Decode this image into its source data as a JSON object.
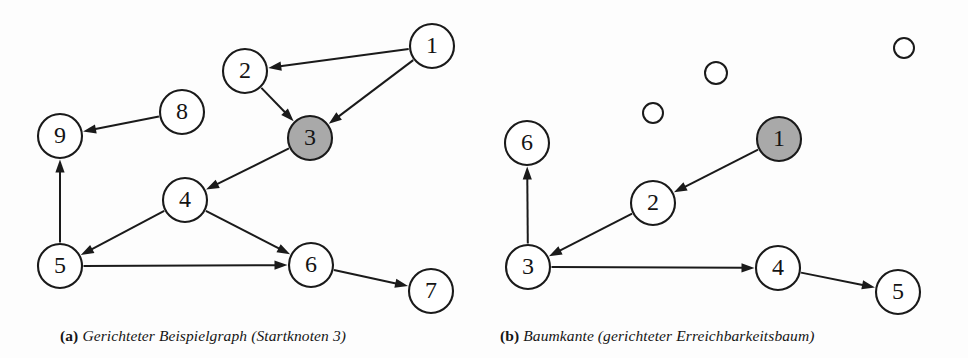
{
  "figure": {
    "background_color": "#fdfdfd",
    "node_fill": "#ffffff",
    "node_stroke": "#1a1a1a",
    "highlight_fill": "#a9a9a9",
    "edge_color": "#1a1a1a"
  },
  "panel_a": {
    "caption_tag": "(a)",
    "caption_text": "Gerichteter Beispielgraph (Startknoten 3)",
    "nodes": [
      {
        "id": "a1",
        "label": "1",
        "cx": 432,
        "cy": 46,
        "r": 22,
        "shaded": false
      },
      {
        "id": "a2",
        "label": "2",
        "cx": 245,
        "cy": 71,
        "r": 22,
        "shaded": false
      },
      {
        "id": "a3",
        "label": "3",
        "cx": 310,
        "cy": 138,
        "r": 22,
        "shaded": true
      },
      {
        "id": "a8",
        "label": "8",
        "cx": 182,
        "cy": 112,
        "r": 22,
        "shaded": false
      },
      {
        "id": "a9",
        "label": "9",
        "cx": 60,
        "cy": 136,
        "r": 22,
        "shaded": false
      },
      {
        "id": "a4",
        "label": "4",
        "cx": 185,
        "cy": 200,
        "r": 22,
        "shaded": false
      },
      {
        "id": "a5",
        "label": "5",
        "cx": 60,
        "cy": 266,
        "r": 22,
        "shaded": false
      },
      {
        "id": "a6",
        "label": "6",
        "cx": 311,
        "cy": 265,
        "r": 22,
        "shaded": false
      },
      {
        "id": "a7",
        "label": "7",
        "cx": 431,
        "cy": 291,
        "r": 22,
        "shaded": false
      }
    ],
    "edges": [
      {
        "from": "a1",
        "to": "a2",
        "directed": true
      },
      {
        "from": "a1",
        "to": "a3",
        "directed": true
      },
      {
        "from": "a2",
        "to": "a3",
        "directed": true
      },
      {
        "from": "a3",
        "to": "a4",
        "directed": true
      },
      {
        "from": "a8",
        "to": "a9",
        "directed": true
      },
      {
        "from": "a5",
        "to": "a9",
        "directed": true
      },
      {
        "from": "a4",
        "to": "a5",
        "directed": true
      },
      {
        "from": "a4",
        "to": "a6",
        "directed": true
      },
      {
        "from": "a5",
        "to": "a6",
        "directed": true
      },
      {
        "from": "a6",
        "to": "a7",
        "directed": true
      }
    ]
  },
  "panel_b": {
    "caption_tag": "(b)",
    "caption_text": "Baumkante (gerichteter Erreichbarkeitsbaum)",
    "nodes": [
      {
        "id": "b1",
        "label": "1",
        "cx": 779,
        "cy": 139,
        "r": 22,
        "shaded": true
      },
      {
        "id": "b2",
        "label": "2",
        "cx": 653,
        "cy": 203,
        "r": 22,
        "shaded": false
      },
      {
        "id": "b3",
        "label": "3",
        "cx": 528,
        "cy": 267,
        "r": 22,
        "shaded": false
      },
      {
        "id": "b4",
        "label": "4",
        "cx": 778,
        "cy": 268,
        "r": 22,
        "shaded": false
      },
      {
        "id": "b5",
        "label": "5",
        "cx": 898,
        "cy": 292,
        "r": 22,
        "shaded": false
      },
      {
        "id": "b6",
        "label": "6",
        "cx": 527,
        "cy": 143,
        "r": 22,
        "shaded": false
      }
    ],
    "empty_nodes": [
      {
        "id": "be1",
        "cx": 653,
        "cy": 113,
        "r": 10
      },
      {
        "id": "be2",
        "cx": 716,
        "cy": 73,
        "r": 11
      },
      {
        "id": "be3",
        "cx": 904,
        "cy": 48,
        "r": 10
      }
    ],
    "edges": [
      {
        "from": "b1",
        "to": "b2",
        "directed": true
      },
      {
        "from": "b2",
        "to": "b3",
        "directed": true
      },
      {
        "from": "b3",
        "to": "b6",
        "directed": true
      },
      {
        "from": "b3",
        "to": "b4",
        "directed": true
      },
      {
        "from": "b4",
        "to": "b5",
        "directed": true
      }
    ]
  }
}
